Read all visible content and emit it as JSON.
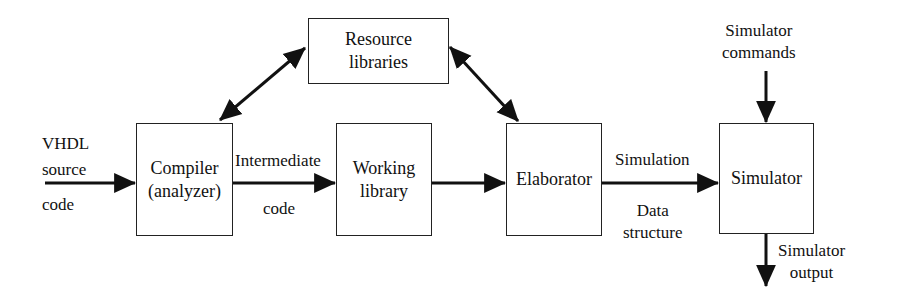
{
  "diagram": {
    "type": "block-flow",
    "blocks": {
      "compiler": "Compiler\n(analyzer)",
      "working_library": "Working\nlibrary",
      "elaborator": "Elaborator",
      "simulator": "Simulator",
      "resource_libraries": "Resource\nlibraries"
    },
    "labels": {
      "vhdl_line1": "VHDL",
      "vhdl_line2": "source",
      "vhdl_line3": "code",
      "intermediate": "Intermediate",
      "intermediate_code": "code",
      "simulation": "Simulation",
      "data_structure": "Data\nstructure",
      "sim_commands": "Simulator\ncommands",
      "sim_output": "Simulator\noutput"
    },
    "edges": [
      {
        "from": "VHDL source code",
        "to": "Compiler (analyzer)"
      },
      {
        "from": "Compiler (analyzer)",
        "to": "Working library",
        "label": "Intermediate code"
      },
      {
        "from": "Working library",
        "to": "Elaborator"
      },
      {
        "from": "Elaborator",
        "to": "Simulator",
        "label": "Simulation Data structure"
      },
      {
        "from": "Simulator commands",
        "to": "Simulator"
      },
      {
        "from": "Simulator",
        "to": "Simulator output"
      },
      {
        "from": "Compiler (analyzer)",
        "to": "Resource libraries",
        "bidirectional": true
      },
      {
        "from": "Elaborator",
        "to": "Resource libraries",
        "bidirectional": true
      }
    ]
  }
}
